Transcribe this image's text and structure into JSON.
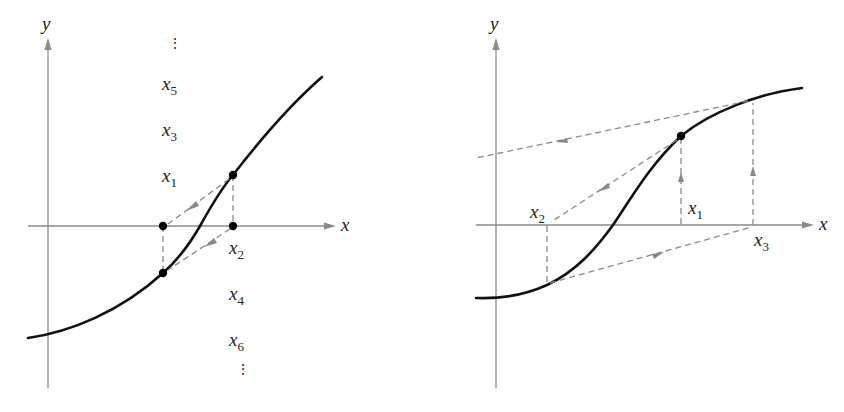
{
  "panels": [
    {
      "id": "left",
      "description": "Fixed-point iteration oscillating between two values (non-convergent cycle)",
      "axis_labels": {
        "x": "x",
        "y": "y"
      },
      "labels_above": [
        {
          "var": "x",
          "sub": "5"
        },
        {
          "var": "x",
          "sub": "3"
        },
        {
          "var": "x",
          "sub": "1"
        }
      ],
      "labels_below": [
        {
          "var": "x",
          "sub": "2"
        },
        {
          "var": "x",
          "sub": "4"
        },
        {
          "var": "x",
          "sub": "6"
        }
      ],
      "ellipsis": "⋮"
    },
    {
      "id": "right",
      "description": "Fixed-point iteration diverging",
      "axis_labels": {
        "x": "x",
        "y": "y"
      },
      "point_labels": [
        {
          "var": "x",
          "sub": "1"
        },
        {
          "var": "x",
          "sub": "2"
        },
        {
          "var": "x",
          "sub": "3"
        }
      ]
    }
  ],
  "colors": {
    "curve": "#111111",
    "axes": "#8a8a8a",
    "dashed_lines": "#8a8a8a",
    "points": "#000000"
  }
}
